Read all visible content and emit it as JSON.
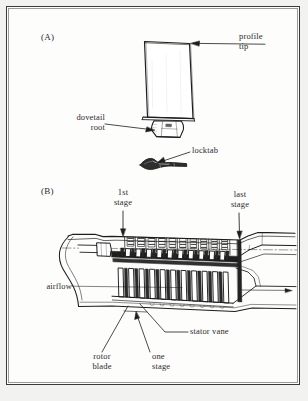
{
  "figure": {
    "background_color": "#f2f2f0",
    "page_color": "#fdfdfc",
    "ink_color": "#2b2b2b",
    "panels": [
      {
        "tag": "(A)",
        "name": "compressor-blade-detail",
        "labels": [
          {
            "id": "profile-tip",
            "text": "profile\ntip"
          },
          {
            "id": "dovetail-root",
            "text": "dovetail\nroot"
          },
          {
            "id": "locktab",
            "text": "locktab"
          }
        ]
      },
      {
        "tag": "(B)",
        "name": "axial-compressor-cross-section",
        "labels": [
          {
            "id": "first-stage",
            "text": "1st\nstage"
          },
          {
            "id": "last-stage",
            "text": "last\nstage"
          },
          {
            "id": "airflow",
            "text": "airflow"
          },
          {
            "id": "rotor-blade",
            "text": "rotor\nblade"
          },
          {
            "id": "one-stage",
            "text": "one\nstage"
          },
          {
            "id": "stator-vane",
            "text": "stator vane"
          }
        ]
      }
    ]
  },
  "panel_a": {
    "tag": "(A)",
    "profile_tip": "profile\ntip",
    "dovetail_root": "dovetail\nroot",
    "locktab": "locktab"
  },
  "panel_b": {
    "tag": "(B)",
    "first_stage": "1st\nstage",
    "last_stage": "last\nstage",
    "airflow": "airflow",
    "rotor_blade": "rotor\nblade",
    "one_stage": "one\nstage",
    "stator_vane": "stator vane"
  }
}
